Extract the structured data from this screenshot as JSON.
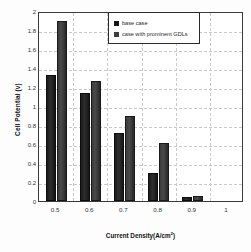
{
  "chart_data": {
    "type": "bar",
    "title": "",
    "xlabel": "Current Density(A/cm",
    "xlabel_sup": "2",
    "xlabel_tail": ")",
    "xlabel_full": "Current Density(A/cm2)",
    "ylabel": "Cell Potential (v)",
    "categories": [
      "0.5",
      "0.6",
      "0.7",
      "0.8",
      "0.9",
      "1"
    ],
    "series": [
      {
        "name": "base case",
        "values": [
          1.33,
          1.14,
          0.72,
          0.29,
          0.04,
          0.0
        ],
        "color": "#151515"
      },
      {
        "name": "case with prominent GDLs",
        "values": [
          1.89,
          1.26,
          0.9,
          0.61,
          0.05,
          0.0
        ],
        "color": "#3d3d3d"
      }
    ],
    "ylim": [
      0,
      2
    ],
    "yticks": [
      "0",
      "0.2",
      "0.4",
      "0.6",
      "0.8",
      "1",
      "1.2",
      "1.4",
      "1.6",
      "1.8",
      "2"
    ],
    "ytick_values": [
      0,
      0.2,
      0.4,
      0.6,
      0.8,
      1.0,
      1.2,
      1.4,
      1.6,
      1.8,
      2.0
    ],
    "grid": true,
    "grid_style": "dashed",
    "legend_position": "upper-right",
    "legend_border": true,
    "plot_border": true
  }
}
